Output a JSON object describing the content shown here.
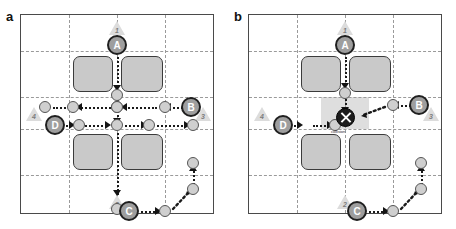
{
  "figure": {
    "type": "multi-agent-path-planning-diagram",
    "panels": [
      {
        "id": "a",
        "label": "a",
        "caption": "",
        "grid": {
          "columns": 4,
          "rows": 4,
          "style": "dashed"
        },
        "obstacles": [
          {
            "name": "obstacle-top-left"
          },
          {
            "name": "obstacle-top-right"
          },
          {
            "name": "obstacle-bottom-left"
          },
          {
            "name": "obstacle-bottom-right"
          }
        ],
        "agents": [
          {
            "id": "A",
            "label": "A"
          },
          {
            "id": "B",
            "label": "B"
          },
          {
            "id": "C",
            "label": "C"
          },
          {
            "id": "D",
            "label": "D"
          }
        ],
        "goals": [
          {
            "id": "1",
            "label": "1",
            "position": "top"
          },
          {
            "id": "2",
            "label": "2",
            "position": "bottom"
          },
          {
            "id": "3",
            "label": "3",
            "position": "right"
          },
          {
            "id": "4",
            "label": "4",
            "position": "left"
          }
        ],
        "waypoints": [
          {
            "id": "a-wp-a1",
            "label": ""
          },
          {
            "id": "a-wp-a2",
            "label": ""
          },
          {
            "id": "a-wp-a3",
            "label": ""
          },
          {
            "id": "a-wp-b1",
            "label": ""
          },
          {
            "id": "a-wp-b2",
            "label": ""
          },
          {
            "id": "a-wp-b3",
            "label": ""
          },
          {
            "id": "a-wp-d1",
            "label": ""
          },
          {
            "id": "a-wp-d2",
            "label": ""
          },
          {
            "id": "a-wp-d3",
            "label": ""
          },
          {
            "id": "a-wp-c1",
            "label": ""
          },
          {
            "id": "a-wp-c2",
            "label": ""
          },
          {
            "id": "a-wp-c3",
            "label": ""
          }
        ],
        "paths": [
          {
            "agent": "A",
            "to_goal": "2",
            "direction": "down"
          },
          {
            "agent": "B",
            "to_goal": "4",
            "direction": "left"
          },
          {
            "agent": "D",
            "to_goal": "3",
            "direction": "right"
          },
          {
            "agent": "C",
            "to_goal": "1",
            "direction": "right-then-up"
          }
        ],
        "conflict": null
      },
      {
        "id": "b",
        "label": "b",
        "caption": "",
        "grid": {
          "columns": 4,
          "rows": 4,
          "style": "dashed"
        },
        "obstacles": [
          {
            "name": "obstacle-top-left"
          },
          {
            "name": "obstacle-top-right"
          },
          {
            "name": "obstacle-bottom-left"
          },
          {
            "name": "obstacle-bottom-right"
          }
        ],
        "agents": [
          {
            "id": "A",
            "label": "A"
          },
          {
            "id": "B",
            "label": "B"
          },
          {
            "id": "C",
            "label": "C"
          },
          {
            "id": "D",
            "label": "D"
          }
        ],
        "goals": [
          {
            "id": "1",
            "label": "1",
            "position": "top"
          },
          {
            "id": "2",
            "label": "2",
            "position": "bottom"
          },
          {
            "id": "3",
            "label": "3",
            "position": "right"
          },
          {
            "id": "4",
            "label": "4",
            "position": "left"
          }
        ],
        "waypoints": [
          {
            "id": "b-wp-a1",
            "label": ""
          },
          {
            "id": "b-wp-b1",
            "label": ""
          },
          {
            "id": "b-wp-d1",
            "label": ""
          },
          {
            "id": "b-wp-c1",
            "label": ""
          },
          {
            "id": "b-wp-c2",
            "label": ""
          },
          {
            "id": "b-wp-c3",
            "label": ""
          }
        ],
        "paths": [
          {
            "agent": "A",
            "to_goal": "conflict",
            "direction": "down"
          },
          {
            "agent": "B",
            "to_goal": "conflict",
            "direction": "left"
          },
          {
            "agent": "D",
            "to_goal": "conflict",
            "direction": "right"
          },
          {
            "agent": "C",
            "to_goal": "1",
            "direction": "right-then-up"
          }
        ],
        "conflict": {
          "marker": "collision-icon",
          "label": "collision",
          "cell": "center"
        }
      }
    ]
  },
  "colors": {
    "agent_fill": "#9e9e9e",
    "agent_stroke": "#1f1f1f",
    "obstacle_fill": "#c9c9c9",
    "obstacle_stroke": "#3b3b3b",
    "waypoint_fill": "#cfcfcf",
    "grid_line": "#9a9a9a",
    "path": "#1a1a1a",
    "goal_fill": "#dcdcdc",
    "conflict_fill": "#c9c9c9",
    "panel_border": "#4a4a4a"
  }
}
